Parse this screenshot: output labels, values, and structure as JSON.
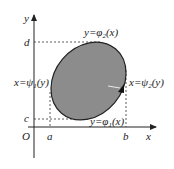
{
  "diagram": {
    "title": "",
    "colors": {
      "region_fill": "#8c8c8c",
      "stroke": "#222222",
      "background": "#ffffff"
    },
    "axes": {
      "x_label": "x",
      "y_label": "y",
      "origin_label": "O"
    },
    "ticks": {
      "a": "a",
      "b": "b",
      "c": "c",
      "d": "d"
    },
    "curves": {
      "upper": {
        "lhs": "y=φ",
        "sub": "2",
        "arg": "(x)"
      },
      "lower": {
        "lhs": "y=φ",
        "sub": "1",
        "arg": "(x)"
      },
      "left": {
        "lhs": "x=ψ",
        "sub": "1",
        "arg": "(y)"
      },
      "right": {
        "lhs": "x=ψ",
        "sub": "2",
        "arg": "(y)"
      }
    },
    "region": {
      "shape": "tilted-ellipse",
      "shaded": true
    }
  }
}
